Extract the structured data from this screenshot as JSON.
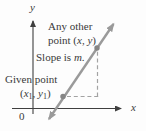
{
  "figure": {
    "colors": {
      "background": "#fdfdfd",
      "axis": "#3f3f3f",
      "text": "#3a3a3a",
      "line": "#9a9a9a",
      "point": "#858585",
      "dash": "#a3a3a3"
    },
    "axis_labels": {
      "x": "x",
      "y": "y",
      "origin": "0"
    },
    "annotations": {
      "any_other_line1": "Any other",
      "any_other_line2_prefix": "point (",
      "any_other_x": "x",
      "any_other_comma": ", ",
      "any_other_y": "y",
      "any_other_close": ")",
      "slope_prefix": "Slope is ",
      "slope_m": "m",
      "slope_period": ".",
      "given_line1": "Given point",
      "given_open": "(",
      "given_x": "x",
      "given_x_sub": "1",
      "given_comma": ", ",
      "given_y": "y",
      "given_y_sub": "1",
      "given_close": ")"
    }
  }
}
